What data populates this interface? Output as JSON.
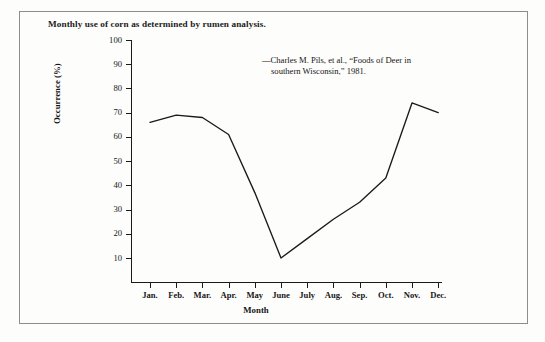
{
  "figure": {
    "title": "Monthly use of corn as determined by rumen analysis.",
    "annotation_line_1": "—Charles M. Pils, et al., “Foods of Deer in",
    "annotation_line_2": "southern Wisconsin,” 1981.",
    "line_color": "#1a1a1a",
    "axis_color": "#1a1a1a",
    "border_color": "#8d8d8d",
    "background_color": "#fdfdfc"
  },
  "chart_data": {
    "type": "line",
    "title": "Monthly use of corn as determined by rumen analysis.",
    "xlabel": "Month",
    "ylabel": "Occurrence (%)",
    "categories": [
      "Jan.",
      "Feb.",
      "Mar.",
      "Apr.",
      "May",
      "June",
      "July",
      "Aug.",
      "Sep.",
      "Oct.",
      "Nov.",
      "Dec."
    ],
    "values": [
      66,
      69,
      68,
      61,
      37,
      10,
      18,
      26,
      33,
      43,
      74,
      70
    ],
    "series": [
      {
        "name": "Corn occurrence",
        "values": [
          66,
          69,
          68,
          61,
          37,
          10,
          18,
          26,
          33,
          43,
          74,
          70
        ]
      }
    ],
    "ylim": [
      0,
      100
    ],
    "yticks": [
      10,
      20,
      30,
      40,
      50,
      60,
      70,
      80,
      90,
      100
    ],
    "ytick_labels": [
      "10",
      "20",
      "30",
      "40",
      "50",
      "60",
      "70",
      "80",
      "90",
      "100"
    ],
    "xtick_labels": [
      "Jan.",
      "Feb.",
      "Mar.",
      "Apr.",
      "May",
      "June",
      "July",
      "Aug.",
      "Sep.",
      "Oct.",
      "Nov.",
      "Dec."
    ],
    "grid": false,
    "legend": null,
    "annotations": [
      "—Charles M. Pils, et al., “Foods of Deer in southern Wisconsin,” 1981."
    ]
  }
}
